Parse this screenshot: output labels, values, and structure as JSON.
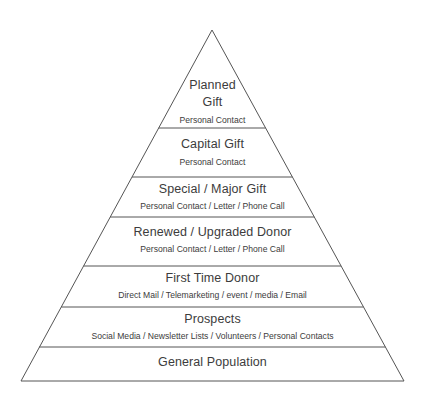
{
  "diagram": {
    "type": "pyramid",
    "tiers": [
      {
        "title_line1": "Planned",
        "title_line2": "Gift",
        "subtitle": "Personal Contact"
      },
      {
        "title": "Capital Gift",
        "subtitle": "Personal Contact"
      },
      {
        "title": "Special / Major Gift",
        "subtitle": "Personal Contact / Letter / Phone Call"
      },
      {
        "title": "Renewed / Upgraded Donor",
        "subtitle": "Personal Contact / Letter / Phone Call"
      },
      {
        "title": "First Time Donor",
        "subtitle": "Direct Mail / Telemarketing / event / media / Email"
      },
      {
        "title": "Prospects",
        "subtitle": "Social Media / Newsletter Lists / Volunteers / Personal Contacts"
      },
      {
        "title": "General Population"
      }
    ],
    "colors": {
      "line": "#555555",
      "text": "#3c3c3c",
      "background": "#ffffff"
    }
  }
}
